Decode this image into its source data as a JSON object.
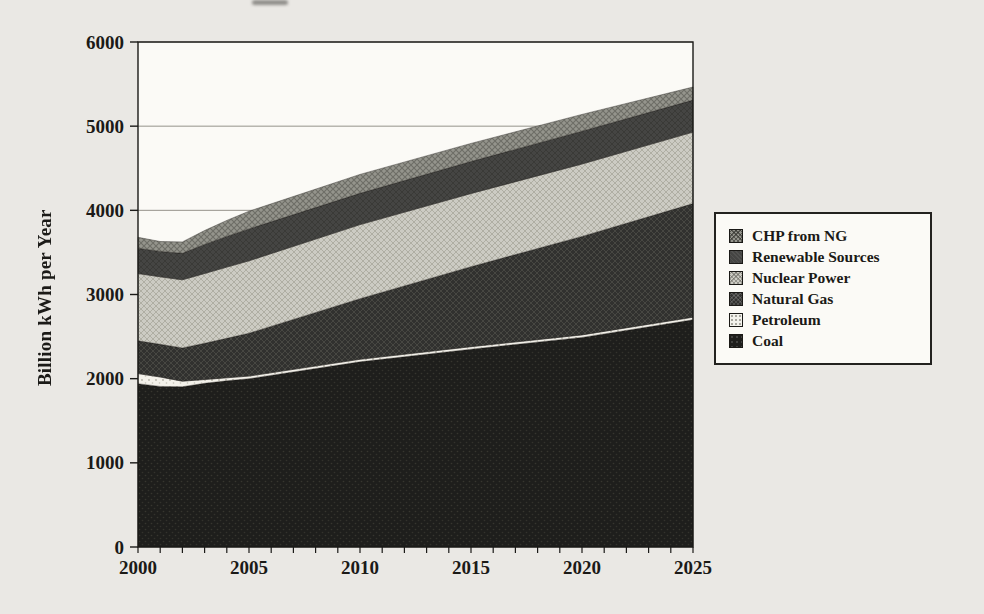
{
  "page": {
    "background": "#eae8e4",
    "plot_background": "#fbfaf6",
    "frame_color": "#1b1a18",
    "gridline_color": "#7b796f",
    "text_color": "#1b1a17"
  },
  "chart_data": {
    "type": "area",
    "stacked": true,
    "title": "",
    "xlabel": "",
    "ylabel": "Billion kWh per Year",
    "unit": "Billion kWh per Year",
    "xlim": [
      2000,
      2025
    ],
    "ylim": [
      0,
      6000
    ],
    "x_ticks": [
      2000,
      2005,
      2010,
      2015,
      2020,
      2025
    ],
    "x_minor_tick_step": 1,
    "y_ticks": [
      0,
      1000,
      2000,
      3000,
      4000,
      5000,
      6000
    ],
    "grid": "horizontal",
    "legend_position": "right",
    "x": [
      2000,
      2001,
      2002,
      2003,
      2004,
      2005,
      2010,
      2015,
      2020,
      2025
    ],
    "series": [
      {
        "name": "Coal",
        "slug": "coal",
        "values": [
          1940,
          1908,
          1905,
          1945,
          1975,
          2000,
          2200,
          2350,
          2490,
          2700
        ]
      },
      {
        "name": "Petroleum",
        "slug": "petroleum",
        "values": [
          120,
          112,
          65,
          45,
          35,
          30,
          30,
          30,
          30,
          30
        ]
      },
      {
        "name": "Natural Gas",
        "slug": "natural-gas",
        "values": [
          390,
          388,
          395,
          430,
          470,
          510,
          720,
          950,
          1170,
          1350
        ]
      },
      {
        "name": "Nuclear Power",
        "slug": "nuclear-power",
        "values": [
          800,
          802,
          810,
          830,
          845,
          860,
          880,
          870,
          860,
          850
        ]
      },
      {
        "name": "Renewable Sources",
        "slug": "renewable-sources",
        "values": [
          300,
          302,
          315,
          345,
          365,
          380,
          372,
          380,
          390,
          380
        ]
      },
      {
        "name": "CHP from NG",
        "slug": "chp-from-ng",
        "values": [
          130,
          118,
          135,
          165,
          190,
          210,
          225,
          215,
          200,
          155
        ]
      }
    ],
    "stack_totals": [
      3680,
      3630,
      3625,
      3760,
      3880,
      3990,
      4427,
      4795,
      5140,
      5465
    ],
    "legend_order": [
      "chp-from-ng",
      "renewable-sources",
      "nuclear-power",
      "natural-gas",
      "petroleum",
      "coal"
    ]
  }
}
